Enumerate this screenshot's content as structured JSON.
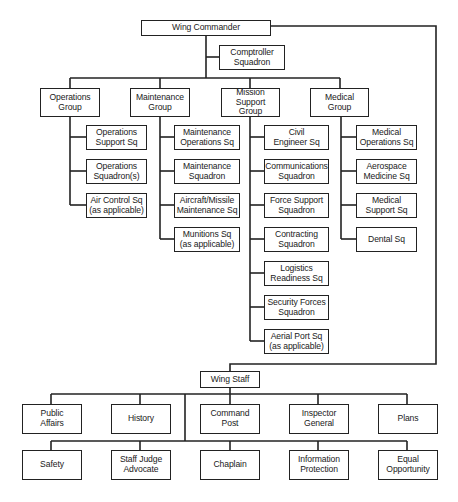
{
  "commander": {
    "label": "Wing Commander"
  },
  "comptroller": {
    "label": "Comptroller\nSquadron"
  },
  "groups": [
    {
      "label": "Operations\nGroup",
      "children": [
        "Operations\nSupport Sq",
        "Operations\nSquadron(s)",
        "Air Control Sq\n(as applicable)"
      ]
    },
    {
      "label": "Maintenance\nGroup",
      "children": [
        "Maintenance\nOperations Sq",
        "Maintenance\nSquadron",
        "Aircraft/Missile\nMaintenance Sq",
        "Munitions Sq\n(as applicable)"
      ]
    },
    {
      "label": "Mission Support\nGroup",
      "children": [
        "Civil\nEngineer Sq",
        "Communications\nSquadron",
        "Force Support\nSquadron",
        "Contracting\nSquadron",
        "Logistics\nReadiness Sq",
        "Security Forces\nSquadron",
        "Aerial Port Sq\n(as applicable)"
      ]
    },
    {
      "label": "Medical\nGroup",
      "children": [
        "Medical\nOperations Sq",
        "Aerospace\nMedicine Sq",
        "Medical\nSupport Sq",
        "Dental Sq"
      ]
    }
  ],
  "wing_staff": {
    "label": "Wing Staff",
    "row1": [
      "Public\nAffairs",
      "History",
      "Command\nPost",
      "Inspector\nGeneral",
      "Plans"
    ],
    "row2": [
      "Safety",
      "Staff Judge\nAdvocate",
      "Chaplain",
      "Information\nProtection",
      "Equal\nOpportunity"
    ]
  },
  "colors": {
    "line": "#222222",
    "box_border": "#222222",
    "background": "#ffffff"
  }
}
